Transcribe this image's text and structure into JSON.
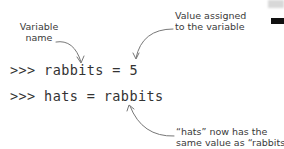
{
  "annotations": {
    "variable_name": {
      "line1": "Variable",
      "line2": "name"
    },
    "value_assigned": {
      "line1": "Value assigned",
      "line2": "to the variable"
    },
    "hats_note": {
      "line1": "“hats” now has the",
      "line2": "same value as “rabbits”"
    }
  },
  "code": {
    "line1": ">>> rabbits = 5",
    "line2": ">>> hats = rabbits"
  },
  "colors": {
    "text": "#333333",
    "annotation": "#3a3a3a",
    "arrow": "#777777"
  }
}
